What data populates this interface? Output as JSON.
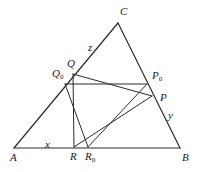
{
  "figure": {
    "type": "euclidean-geometry-diagram",
    "width": 198,
    "height": 172,
    "stroke_color": "#2b2b2b",
    "background_color": "#ffffff"
  },
  "points": {
    "A": {
      "label": "A",
      "sub": "",
      "x": 14,
      "y": 148,
      "label_x": 10,
      "label_y": 152
    },
    "B": {
      "label": "B",
      "sub": "",
      "x": 180,
      "y": 148,
      "label_x": 182,
      "label_y": 152
    },
    "C": {
      "label": "C",
      "sub": "",
      "x": 118,
      "y": 23,
      "label_x": 120,
      "label_y": 6
    },
    "P": {
      "label": "P",
      "sub": "",
      "x": 152,
      "y": 96,
      "label_x": 160,
      "label_y": 92
    },
    "Q": {
      "label": "Q",
      "sub": "",
      "x": 73,
      "y": 74,
      "label_x": 67,
      "label_y": 58
    },
    "R": {
      "label": "R",
      "sub": "",
      "x": 74,
      "y": 147,
      "label_x": 70,
      "label_y": 151
    },
    "P0": {
      "label": "P",
      "sub": "0",
      "x": 147,
      "y": 84,
      "label_x": 152,
      "label_y": 70
    },
    "Q0": {
      "label": "Q",
      "sub": "0",
      "x": 65,
      "y": 84,
      "label_x": 52,
      "label_y": 68
    },
    "R0": {
      "label": "R",
      "sub": "0",
      "x": 88,
      "y": 147,
      "label_x": 85,
      "label_y": 151
    },
    "I": {
      "label": "",
      "sub": "",
      "x": 113,
      "y": 121,
      "label_x": 0,
      "label_y": 0
    }
  },
  "side_labels": {
    "x": {
      "text": "x",
      "label_x": 45,
      "label_y": 139
    },
    "y": {
      "text": "y",
      "label_x": 168,
      "label_y": 110
    },
    "z": {
      "text": "z",
      "label_x": 88,
      "label_y": 42
    }
  },
  "segments": [
    {
      "name": "side-AB",
      "from": "A",
      "to": "B",
      "width": 1.2
    },
    {
      "name": "side-AC",
      "from": "A",
      "to": "C",
      "width": 1.2
    },
    {
      "name": "side-BC",
      "from": "C",
      "to": "B",
      "width": 1.2
    },
    {
      "name": "triangle-PQR-QP",
      "from": "Q",
      "to": "P",
      "width": 1.0
    },
    {
      "name": "triangle-PQR-PR",
      "from": "P",
      "to": "R",
      "width": 1.0
    },
    {
      "name": "triangle-PQR-RQ",
      "from": "R",
      "to": "Q",
      "width": 1.0
    },
    {
      "name": "triangle-P0Q0R0-Q0P0",
      "from": "Q0",
      "to": "P0",
      "width": 1.0
    },
    {
      "name": "triangle-P0Q0R0-P0R0",
      "from": "P0",
      "to": "R0",
      "width": 1.0
    },
    {
      "name": "triangle-P0Q0R0-R0Q0",
      "from": "R0",
      "to": "Q0",
      "width": 1.0
    }
  ]
}
